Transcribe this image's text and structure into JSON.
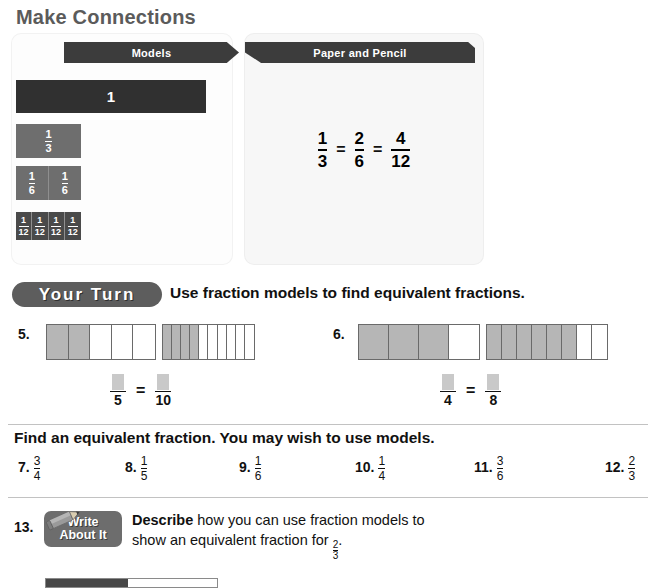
{
  "make_connections": {
    "title": "Make Connections",
    "models_banner": "Models",
    "paper_banner": "Paper and Pencil",
    "model_strips": [
      {
        "name": "whole",
        "label": "1",
        "parts": 1
      },
      {
        "name": "thirds",
        "numerator": "1",
        "denominator": "3",
        "parts": 1
      },
      {
        "name": "sixths",
        "numerator": "1",
        "denominator": "6",
        "parts": 2
      },
      {
        "name": "twelfths",
        "numerator": "1",
        "denominator": "12",
        "parts": 4
      }
    ],
    "equation": {
      "fraction_1": {
        "numerator": "1",
        "denominator": "3"
      },
      "operator_1": "=",
      "fraction_2": {
        "numerator": "2",
        "denominator": "6"
      },
      "operator_2": "=",
      "fraction_3": {
        "numerator": "4",
        "denominator": "12"
      }
    }
  },
  "your_turn": {
    "badge": "Your Turn",
    "instruction": "Use fraction models to find equivalent fractions."
  },
  "model_problems": [
    {
      "number": "5.",
      "bar_a": {
        "total": 5,
        "shaded": 2
      },
      "bar_b": {
        "total": 10,
        "shaded": 4
      },
      "answer": {
        "left_denominator": "5",
        "operator": "=",
        "right_denominator": "10"
      }
    },
    {
      "number": "6.",
      "bar_a": {
        "total": 4,
        "shaded": 3
      },
      "bar_b": {
        "total": 8,
        "shaded": 6
      },
      "answer": {
        "left_denominator": "4",
        "operator": "=",
        "right_denominator": "8"
      }
    }
  ],
  "find_section": {
    "instruction": "Find an equivalent fraction. You may wish to use models.",
    "items": [
      {
        "number": "7.",
        "numerator": "3",
        "denominator": "4"
      },
      {
        "number": "8.",
        "numerator": "1",
        "denominator": "5"
      },
      {
        "number": "9.",
        "numerator": "1",
        "denominator": "6"
      },
      {
        "number": "10.",
        "numerator": "1",
        "denominator": "4"
      },
      {
        "number": "11.",
        "numerator": "3",
        "denominator": "6"
      },
      {
        "number": "12.",
        "numerator": "2",
        "denominator": "3"
      }
    ]
  },
  "write_about_it": {
    "number": "13.",
    "badge_line_1": "Write",
    "badge_line_2": "About It",
    "prompt_lead": "Describe",
    "prompt_rest": " how you can use fraction models to show an equivalent fraction for ",
    "prompt_fraction": {
      "numerator": "2",
      "denominator": "3"
    },
    "prompt_end": "."
  },
  "colors": {
    "banner_dark": "#3c3c3c",
    "strip_dark": "#303030",
    "strip_gray": "#6e6e6e",
    "badge_gray": "#5d5d5d",
    "shade_gray": "#b6b6b6",
    "title_gray": "#5b5b5b"
  }
}
